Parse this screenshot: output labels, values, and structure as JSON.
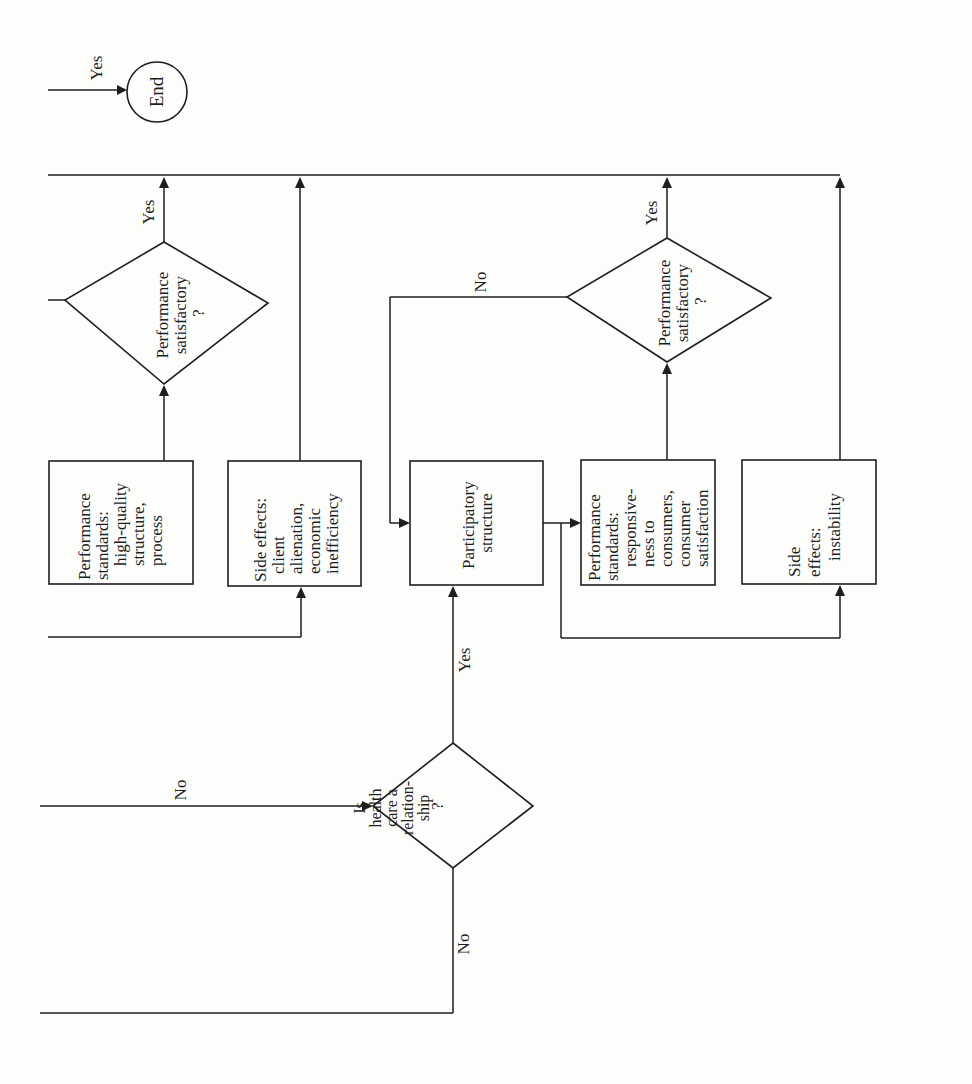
{
  "diagram": {
    "orientation": "rotated 90° counter-clockwise (text reads bottom-to-top)",
    "terminal": {
      "label": "End"
    },
    "decisions": [
      {
        "id": "d1",
        "lines": [
          "Performance",
          "satisfactory",
          "?"
        ]
      },
      {
        "id": "d2",
        "lines": [
          "Performance",
          "satisfactory",
          "?"
        ]
      },
      {
        "id": "d3",
        "lines": [
          "Is",
          "health",
          "care a",
          "relation-",
          "ship",
          "?"
        ]
      }
    ],
    "processes": [
      {
        "id": "p1",
        "lines": [
          "Performance",
          "standards:",
          "high-quality",
          "structure,",
          "process"
        ]
      },
      {
        "id": "p2",
        "lines": [
          "Side effects:",
          "client",
          "alienation,",
          "economic",
          "inefficiency"
        ]
      },
      {
        "id": "p3",
        "lines": [
          "Participatory",
          "structure"
        ]
      },
      {
        "id": "p4",
        "lines": [
          "Performance",
          "standards:",
          "responsive-",
          "ness to",
          "consumers,",
          "consumer",
          "satisfaction"
        ]
      },
      {
        "id": "p5",
        "lines": [
          "Side",
          "effects:",
          "instability"
        ]
      }
    ],
    "edge_labels": {
      "to_end": "Yes",
      "d1_yes": "Yes",
      "d2_yes": "Yes",
      "d2_no": "No",
      "d3_yes": "Yes",
      "d3_in_no": "No",
      "d3_no": "No"
    },
    "colors": {
      "ink": "#1e1e1e",
      "paper": "#fdfdfb"
    }
  }
}
